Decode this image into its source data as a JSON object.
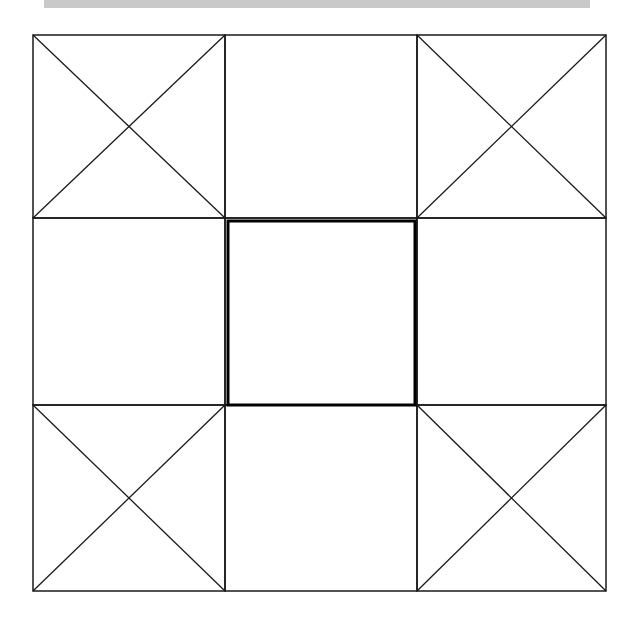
{
  "diagram": {
    "colors": {
      "stroke": "#1a1a1a",
      "bold_stroke": "#000000",
      "background": "#ffffff",
      "top_bar": "#c9c9c9"
    },
    "grid": {
      "x_lines": [
        33,
        225,
        417,
        606
      ],
      "y_lines": [
        35,
        218,
        405,
        591
      ]
    },
    "cells": [
      {
        "id": "top-left",
        "row": 0,
        "col": 0,
        "crossed": true
      },
      {
        "id": "top-middle",
        "row": 0,
        "col": 1,
        "crossed": false
      },
      {
        "id": "top-right",
        "row": 0,
        "col": 2,
        "crossed": true
      },
      {
        "id": "middle-left",
        "row": 1,
        "col": 0,
        "crossed": false
      },
      {
        "id": "center",
        "row": 1,
        "col": 1,
        "crossed": false,
        "bold": true
      },
      {
        "id": "middle-right",
        "row": 1,
        "col": 2,
        "crossed": false
      },
      {
        "id": "bottom-left",
        "row": 2,
        "col": 0,
        "crossed": true
      },
      {
        "id": "bottom-middle",
        "row": 2,
        "col": 1,
        "crossed": false
      },
      {
        "id": "bottom-right",
        "row": 2,
        "col": 2,
        "crossed": true
      }
    ],
    "center_square": {
      "x": 228,
      "y": 221,
      "width": 187,
      "height": 184,
      "stroke_width": 3
    }
  }
}
